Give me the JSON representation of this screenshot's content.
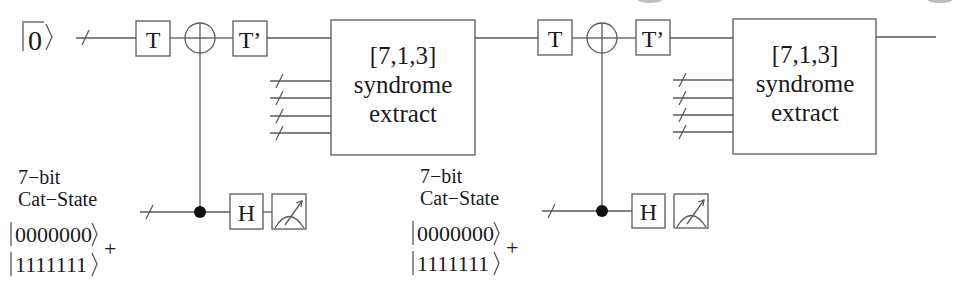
{
  "diagram": {
    "type": "quantum-circuit",
    "input_state": {
      "label": "0",
      "overline": true,
      "ket": true
    },
    "stages": [
      {
        "gates_top": [
          "T",
          "CNOT-target",
          "T'"
        ],
        "syndrome_box": {
          "line1": "[7,1,3]",
          "line2": "syndrome",
          "line3": "extract"
        },
        "bus_inputs": 4,
        "ancilla": {
          "label_line1": "7−bit",
          "label_line2": "Cat−State",
          "ket1": "0000000",
          "ket2": "1111111",
          "plus": "+",
          "gates": [
            "CNOT-control",
            "H",
            "Measure"
          ]
        }
      },
      {
        "gates_top": [
          "T",
          "CNOT-target",
          "T'"
        ],
        "syndrome_box": {
          "line1": "[7,1,3]",
          "line2": "syndrome",
          "line3": "extract"
        },
        "bus_inputs": 4,
        "ancilla": {
          "label_line1": "7−bit",
          "label_line2": "Cat−State",
          "ket1": "0000000",
          "ket2": "1111111",
          "plus": "+",
          "gates": [
            "CNOT-control",
            "H",
            "Measure"
          ]
        }
      }
    ],
    "gate_labels": {
      "t": "T",
      "t_dagger": "T’",
      "h": "H"
    }
  }
}
